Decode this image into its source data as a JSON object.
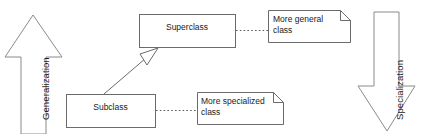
{
  "diagram": {
    "type": "uml-generalization-specialization",
    "classes": [
      {
        "id": "superclass",
        "label": "Superclass",
        "x": 139,
        "y": 14,
        "w": 96,
        "h": 33
      },
      {
        "id": "subclass",
        "label": "Subclass",
        "x": 66,
        "y": 94,
        "w": 89,
        "h": 33
      }
    ],
    "notes": [
      {
        "id": "note-general",
        "label": "More general\nclass",
        "x": 268,
        "y": 10,
        "w": 82,
        "h": 32
      },
      {
        "id": "note-specialized",
        "label": "More specialized\nclass",
        "x": 197,
        "y": 92,
        "w": 86,
        "h": 32
      }
    ],
    "arrows": [
      {
        "id": "generalization",
        "label": "Generalization",
        "direction": "up",
        "side": "left"
      },
      {
        "id": "specialization",
        "label": "Specialization",
        "direction": "down",
        "side": "right"
      }
    ],
    "connectors": [
      {
        "id": "generalization-link",
        "from": "subclass",
        "to": "superclass",
        "style": "hollow-triangle"
      },
      {
        "id": "note-link-general",
        "from": "superclass",
        "to": "note-general",
        "style": "dotted"
      },
      {
        "id": "note-link-specialized",
        "from": "subclass",
        "to": "note-specialized",
        "style": "dotted"
      }
    ],
    "colors": {
      "background": "#ffffff",
      "shape_stroke": "#6b6b6b",
      "arrow_stroke": "#8a8a8a",
      "text": "#1a1a1a"
    }
  }
}
